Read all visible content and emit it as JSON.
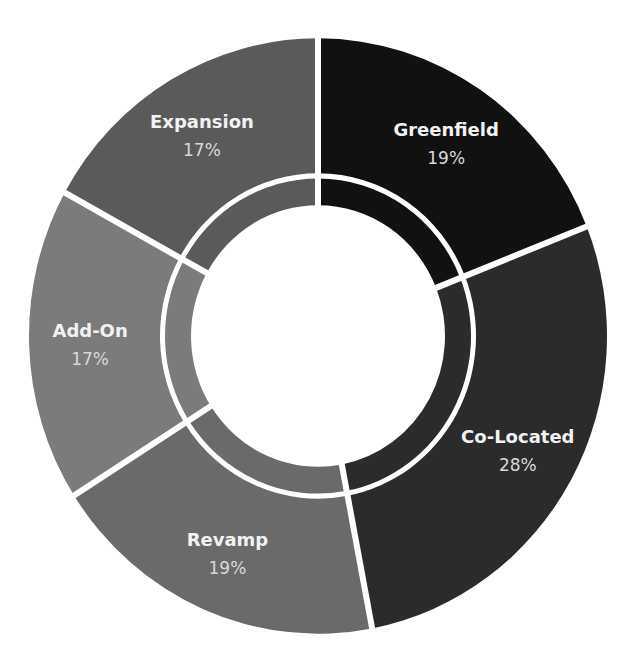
{
  "chart_data": {
    "type": "pie",
    "variant": "donut",
    "title": "",
    "categories": [
      "Greenfield",
      "Co-Located",
      "Revamp",
      "Add-On",
      "Expansion"
    ],
    "values": [
      19,
      28,
      19,
      17,
      17
    ],
    "labels": [
      "19%",
      "28%",
      "19%",
      "17%",
      "17%"
    ],
    "colors": [
      "#111111",
      "#2b2b2b",
      "#6a6a6a",
      "#7b7b7b",
      "#5a5a5a"
    ],
    "start_angle_deg": 0,
    "direction": "clockwise",
    "legend": "none",
    "data_labels": "inside"
  }
}
